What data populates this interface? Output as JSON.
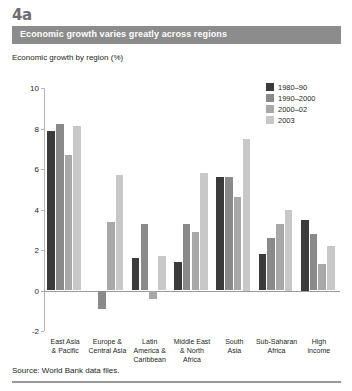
{
  "figure": {
    "number": "4a",
    "banner_title": "Economic growth varies greatly across regions",
    "axis_title": "Economic growth by region (%)",
    "source": "Source: World Bank data files."
  },
  "colors": {
    "banner_bg": "#8c8c8c",
    "series": [
      "#3b3b3b",
      "#8a8a8a",
      "#a8a8a8",
      "#c8c8c8"
    ],
    "axis": "#b5b5b5",
    "zero_line": "#9a9a9a",
    "text": "#231f20"
  },
  "chart_data": {
    "type": "bar",
    "title": "Economic growth varies greatly across regions",
    "subtitle": "Economic growth by region (%)",
    "xlabel": "",
    "ylabel": "Economic growth by region (%)",
    "ylim": [
      -2,
      10
    ],
    "yticks": [
      10,
      8,
      6,
      4,
      2,
      0,
      -2
    ],
    "grid": false,
    "legend_position": "top-right",
    "categories": [
      "East Asia & Pacific",
      "Europe & Central Asia",
      "Latin America & Caribbean",
      "Middle East & North Africa",
      "South Asia",
      "Sub-Saharan Africa",
      "High income"
    ],
    "category_label_lines": [
      [
        "East Asia",
        "& Pacific"
      ],
      [
        "Europe &",
        "Central Asia"
      ],
      [
        "Latin",
        "America &",
        "Caribbean"
      ],
      [
        "Middle East",
        "& North",
        "Africa"
      ],
      [
        "South",
        "Asia"
      ],
      [
        "Sub-Saharan",
        "Africa"
      ],
      [
        "High",
        "income"
      ]
    ],
    "series": [
      {
        "name": "1980–90",
        "color": "#3b3b3b",
        "values": [
          7.9,
          null,
          1.6,
          1.4,
          5.6,
          1.8,
          3.5
        ]
      },
      {
        "name": "1990–2000",
        "color": "#8a8a8a",
        "values": [
          8.2,
          -0.9,
          3.3,
          3.3,
          5.6,
          2.6,
          2.8
        ]
      },
      {
        "name": "2000–02",
        "color": "#a8a8a8",
        "values": [
          6.7,
          3.4,
          -0.4,
          2.9,
          4.6,
          3.3,
          1.3
        ]
      },
      {
        "name": "2003",
        "color": "#c8c8c8",
        "values": [
          8.1,
          5.7,
          1.7,
          5.8,
          7.5,
          4.0,
          2.2
        ]
      }
    ]
  }
}
